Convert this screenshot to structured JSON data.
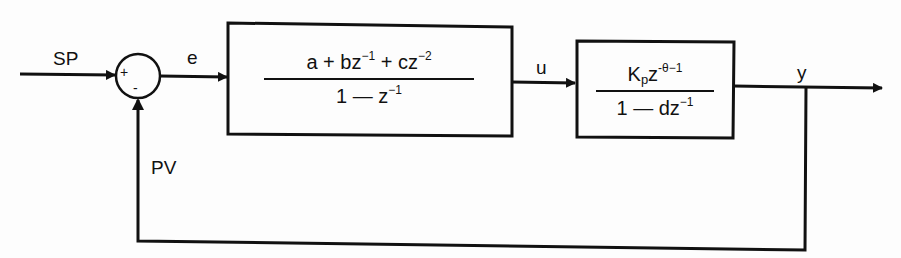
{
  "diagram": {
    "type": "closed-loop block diagram",
    "signals": {
      "setpoint": "SP",
      "error": "e",
      "control": "u",
      "output": "y",
      "process_variable": "PV"
    },
    "summing_junction": {
      "plus_sign": "+",
      "minus_sign": "-"
    },
    "controller_block": {
      "numerator": {
        "a": "a",
        "plus1": " + ",
        "b": "bz",
        "b_exp": "−1",
        "plus2": " + ",
        "c": "cz",
        "c_exp": "−2"
      },
      "denominator": {
        "one": "1 — z",
        "exp": "−1"
      }
    },
    "process_block": {
      "numerator": {
        "k": "K",
        "k_sub": "p",
        "z": "z",
        "z_exp": "-θ−1"
      },
      "denominator": {
        "one": "1 — dz",
        "exp": "−1"
      }
    }
  },
  "colors": {
    "line": "#111111",
    "background": "#fdfdfd"
  }
}
